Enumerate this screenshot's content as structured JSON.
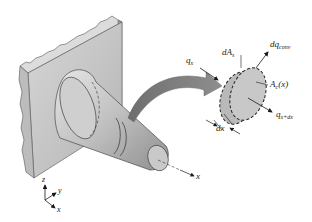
{
  "figure": {
    "type": "heat-transfer-fin-diagram",
    "colors": {
      "wall_face": "#c8c8c8",
      "wall_top": "#dcdcdc",
      "wall_side": "#a8a8a8",
      "fin": "#bdbdbd",
      "element": "#c4c4c4",
      "arrow": "#7a7a7a",
      "ink": "#1a1a1a"
    }
  },
  "labels": {
    "qx": {
      "base": "q",
      "sub": "x"
    },
    "dAs": {
      "base": "dA",
      "sub": "s"
    },
    "dqconv": {
      "base": "dq",
      "sub": "conv"
    },
    "Ac": {
      "base": "A",
      "sub": "c",
      "suffix": "(x)"
    },
    "qxdx": {
      "base": "q",
      "sub": "x+dx"
    },
    "dx": "dx",
    "fin_axis": "x"
  },
  "coordinate_axes": {
    "z": "z",
    "y": "y",
    "x": "x"
  }
}
